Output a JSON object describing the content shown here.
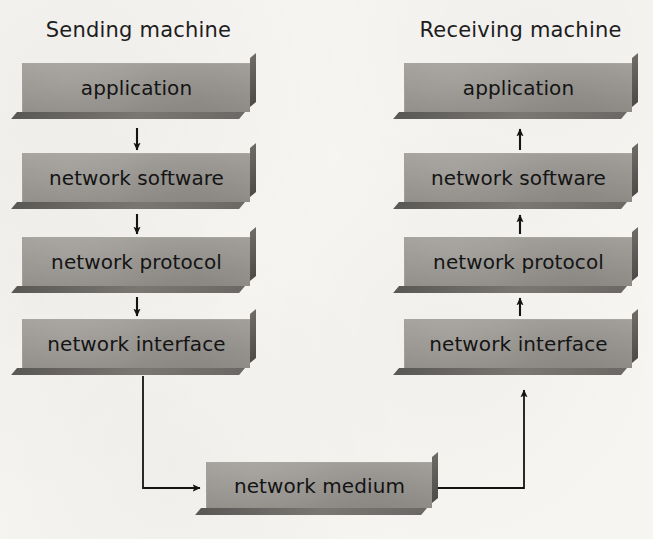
{
  "figure": {
    "background_color": "#f7f5f2",
    "box_color": "#999691",
    "text_color": "#141414",
    "arrow_color": "#1a1a1a"
  },
  "columns": [
    {
      "id": "sending",
      "title": "Sending machine",
      "direction": "down",
      "layers": [
        {
          "label": "application"
        },
        {
          "label": "network software"
        },
        {
          "label": "network protocol"
        },
        {
          "label": "network interface"
        }
      ]
    },
    {
      "id": "receiving",
      "title": "Receiving machine",
      "direction": "up",
      "layers": [
        {
          "label": "application"
        },
        {
          "label": "network software"
        },
        {
          "label": "network protocol"
        },
        {
          "label": "network interface"
        }
      ]
    }
  ],
  "medium": {
    "label": "network medium"
  },
  "flow": {
    "sending_to_medium": "network interface → network medium",
    "medium_to_receiving": "network medium → network interface",
    "sending_arrow_directions": [
      "down",
      "down",
      "down"
    ],
    "receiving_arrow_directions": [
      "up",
      "up",
      "up"
    ]
  }
}
